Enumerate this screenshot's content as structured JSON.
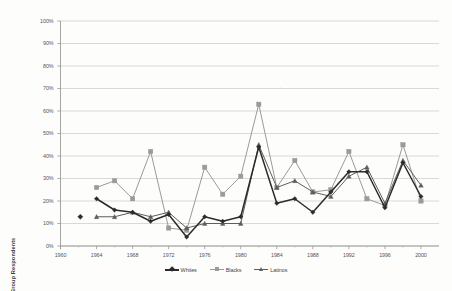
{
  "chart_data": {
    "type": "line",
    "title": "",
    "xlabel": "",
    "ylabel": "% of Group Respondents",
    "xlim": [
      1960,
      2002
    ],
    "ylim": [
      0,
      100
    ],
    "grid": true,
    "legend_position": "bottom",
    "x_ticks": [
      "1960",
      "1964",
      "1968",
      "1972",
      "1976",
      "1980",
      "1984",
      "1988",
      "1992",
      "1996",
      "2000"
    ],
    "y_ticks": [
      "0%",
      "10%",
      "20%",
      "30%",
      "40%",
      "50%",
      "60%",
      "70%",
      "80%",
      "90%",
      "100%"
    ],
    "x": [
      1964,
      1966,
      1968,
      1970,
      1972,
      1974,
      1976,
      1978,
      1980,
      1982,
      1984,
      1986,
      1988,
      1990,
      1992,
      1994,
      1996,
      1998,
      2000
    ],
    "series": [
      {
        "name": "Whites",
        "color": "#2b2b2b",
        "marker": "diamond",
        "values": [
          21,
          16,
          15,
          11,
          14,
          4,
          13,
          11,
          13,
          44,
          19,
          21,
          15,
          24,
          33,
          33,
          17,
          37,
          22
        ]
      },
      {
        "name": "Blacks",
        "color": "#9a9a9a",
        "marker": "square",
        "values": [
          26,
          29,
          21,
          42,
          8,
          7,
          35,
          23,
          31,
          63,
          26,
          38,
          24,
          25,
          42,
          21,
          18,
          45,
          20
        ]
      },
      {
        "name": "Latinos",
        "color": "#5e5e5e",
        "marker": "triangle",
        "values": [
          13,
          13,
          15,
          13,
          15,
          8,
          10,
          10,
          10,
          45,
          26,
          29,
          24,
          22,
          31,
          35,
          19,
          38,
          27
        ]
      }
    ],
    "isolated_points": [
      {
        "series": "Whites",
        "x": 1962.2,
        "y": 13
      }
    ]
  }
}
